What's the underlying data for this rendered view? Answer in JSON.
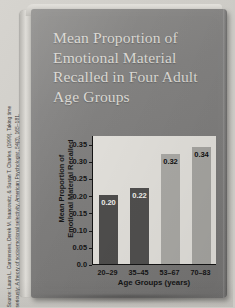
{
  "source": {
    "label": "source-citation",
    "lines": [
      "Source: Laura L. Carstensen, Derek M. Isaacowitz, & Susan T. Charles. (1999). Taking time",
      "seriously: A theory of socioemotional selectivity. American Psychologist, 54(3), 165–181."
    ]
  },
  "book": {
    "cover_title_lines": [
      "Mean Proportion of",
      "Emotional Material",
      "Recalled in Four Adult",
      "Age Groups"
    ],
    "cover_color": "#82817f",
    "title_color": "#d9d7d2"
  },
  "chart_data": {
    "type": "bar",
    "title": "Mean Proportion of Emotional Material Recalled in Four Adult Age Groups",
    "categories": [
      "20–29",
      "35–45",
      "53–67",
      "70–83"
    ],
    "values": [
      0.2,
      0.22,
      0.32,
      0.34
    ],
    "value_labels": [
      "0.20",
      "0.22",
      "0.32",
      "0.34"
    ],
    "xlabel": "Age Groups (years)",
    "ylabel_lines": [
      "Mean Proportion of",
      "Emotional Material Recalled"
    ],
    "ylim": [
      0.0,
      0.375
    ],
    "yticks": [
      0.0,
      0.05,
      0.1,
      0.15,
      0.2,
      0.25,
      0.3,
      0.35
    ],
    "ytick_labels": [
      "0.0",
      "0.05",
      "0.10",
      "0.15",
      "0.20",
      "0.25",
      "0.30",
      "0.35"
    ],
    "grid": false,
    "legend": false,
    "plot_background": "#e0ded9",
    "bar_colors": [
      "#4e4d4c",
      "#504f4e",
      "#a9a8a4",
      "#a5a4a0"
    ]
  }
}
